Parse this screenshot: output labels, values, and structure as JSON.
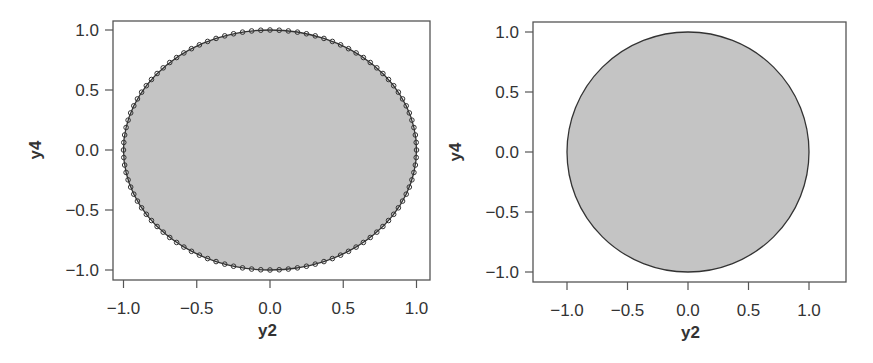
{
  "chart_data": [
    {
      "type": "scatter",
      "panel": "left",
      "title": "",
      "xlabel": "y2",
      "ylabel": "y4",
      "xlim": [
        -1.08,
        1.08
      ],
      "ylim": [
        -1.08,
        1.08
      ],
      "xticks": [
        -1.0,
        -0.5,
        0.0,
        0.5,
        1.0
      ],
      "xtick_labels": [
        "−1.0",
        "−0.5",
        "0.0",
        "0.5",
        "1.0"
      ],
      "yticks": [
        -1.0,
        -0.5,
        0.0,
        0.5,
        1.0
      ],
      "ytick_labels": [
        "−1.0",
        "−0.5",
        "0.0",
        "0.5",
        "1.0"
      ],
      "grid": false,
      "legend": null,
      "series": [
        {
          "name": "filled unit circle region",
          "kind": "filled-polygon",
          "shape": "circle",
          "center": [
            0,
            0
          ],
          "radius": 1.0,
          "fill": "#c4c4c4",
          "stroke": "#333333"
        },
        {
          "name": "boundary points",
          "kind": "points",
          "marker": "open-circle",
          "n_points": 100,
          "param": "y2 = cos(t), y4 = sin(t), t uniform in [0, 2π)",
          "stroke": "#333333"
        }
      ],
      "frame_px": {
        "left": 113,
        "top": 21,
        "right": 430,
        "bottom": 280
      },
      "axis_px": {
        "x0": 270,
        "x_per_unit": 146.5,
        "y0": 150,
        "y_per_unit": 120
      }
    },
    {
      "type": "area",
      "panel": "right",
      "title": "",
      "xlabel": "y2",
      "ylabel": "y4",
      "xlim": [
        -1.28,
        1.3
      ],
      "ylim": [
        -1.08,
        1.08
      ],
      "xticks": [
        -1.0,
        -0.5,
        0.0,
        0.5,
        1.0
      ],
      "xtick_labels": [
        "−1.0",
        "−0.5",
        "0.0",
        "0.5",
        "1.0"
      ],
      "yticks": [
        -1.0,
        -0.5,
        0.0,
        0.5,
        1.0
      ],
      "ytick_labels": [
        "−1.0",
        "−0.5",
        "0.0",
        "0.5",
        "1.0"
      ],
      "grid": false,
      "legend": null,
      "series": [
        {
          "name": "filled unit circle region",
          "kind": "filled-polygon",
          "shape": "circle",
          "center": [
            0,
            0
          ],
          "radius": 1.0,
          "fill": "#c4c4c4",
          "stroke": "#333333"
        }
      ],
      "frame_px": {
        "left": 533,
        "top": 22,
        "right": 846,
        "bottom": 282
      },
      "axis_px": {
        "x0": 688,
        "x_per_unit": 121,
        "y0": 152,
        "y_per_unit": 120
      }
    }
  ],
  "colors": {
    "fill": "#c4c4c4",
    "line": "#333333",
    "frame": "#555555",
    "text": "#333333",
    "background": "#ffffff"
  }
}
